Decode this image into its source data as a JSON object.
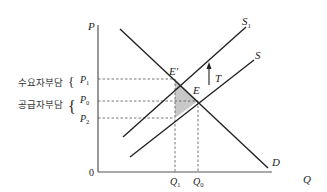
{
  "diagram": {
    "type": "supply-demand-tax-incidence",
    "axes": {
      "y_label": "P",
      "x_label": "Q",
      "origin_label": "0"
    },
    "curves": [
      {
        "id": "D",
        "label": "D",
        "kind": "demand"
      },
      {
        "id": "S",
        "label": "S",
        "kind": "supply"
      },
      {
        "id": "S1",
        "label": "S",
        "subscript": "1",
        "kind": "supply-after-tax"
      }
    ],
    "points": [
      {
        "id": "E_prime",
        "label": "E′"
      },
      {
        "id": "E",
        "label": "E"
      }
    ],
    "shift_arrow": {
      "label": "T"
    },
    "price_ticks": [
      {
        "id": "P1",
        "label": "P",
        "subscript": "1"
      },
      {
        "id": "P0",
        "label": "P",
        "subscript": "0"
      },
      {
        "id": "P2",
        "label": "P",
        "subscript": "2"
      }
    ],
    "quantity_ticks": [
      {
        "id": "Q1",
        "label": "Q",
        "subscript": "1"
      },
      {
        "id": "Q0",
        "label": "Q",
        "subscript": "0"
      }
    ],
    "burden_labels": {
      "consumer": "수요자부담",
      "producer": "공급자부담",
      "brace": "{"
    },
    "colors": {
      "line": "#222222",
      "dashed": "#666666",
      "shade": "#c8c8c8"
    }
  }
}
